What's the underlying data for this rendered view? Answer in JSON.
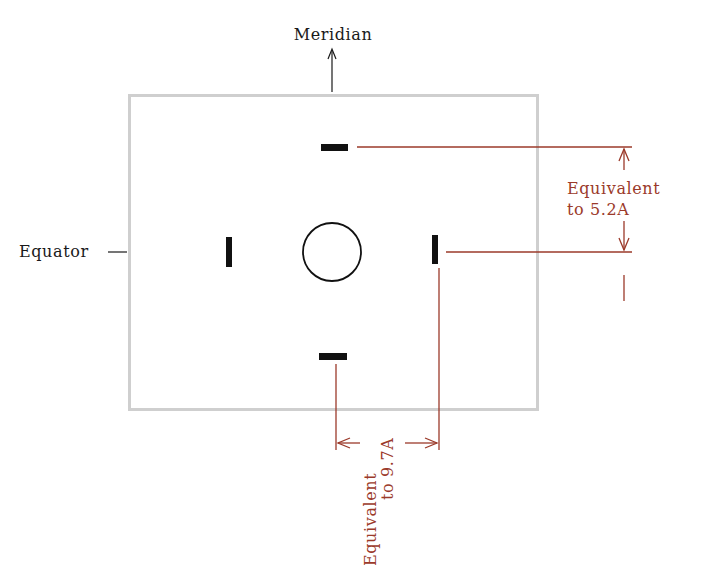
{
  "diagram": {
    "type": "pattern-diagram",
    "labels": {
      "meridian": "Meridian",
      "equator": "Equator",
      "vertical_spacing_line1": "Equivalent",
      "vertical_spacing_line2": "to 5.2A",
      "horizontal_spacing_line1": "Equivalent",
      "horizontal_spacing_line2": "to 9.7A"
    },
    "colors": {
      "frame": "#cfcfcf",
      "marks": "#111111",
      "annotation": "#9b3a2a",
      "label": "#1a1a1a"
    },
    "elements": {
      "frame": {
        "x": 129,
        "y": 95,
        "width": 408,
        "height": 314
      },
      "center_circle": {
        "cx": 332,
        "cy": 252,
        "r": 29
      },
      "marks": [
        {
          "name": "top",
          "x": 321,
          "y": 144,
          "w": 27,
          "h": 7
        },
        {
          "name": "bottom",
          "x": 319,
          "y": 353,
          "w": 28,
          "h": 7
        },
        {
          "name": "left",
          "x": 226,
          "y": 237,
          "w": 6,
          "h": 30
        },
        {
          "name": "right",
          "x": 432,
          "y": 235,
          "w": 6,
          "h": 29
        }
      ]
    }
  }
}
